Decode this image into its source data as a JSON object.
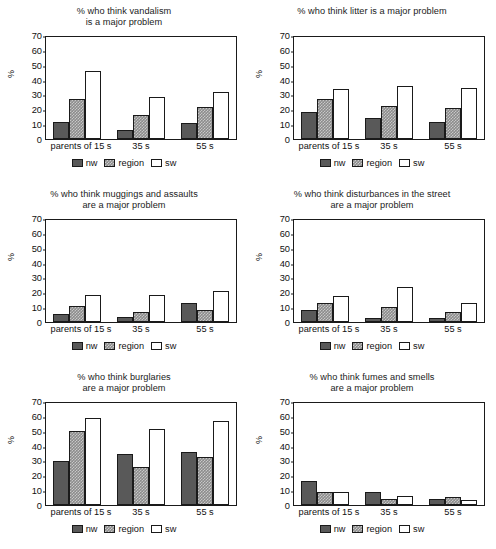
{
  "figure": {
    "axis_label_y": "%",
    "categories": [
      "parents of 15 s",
      "35 s",
      "55 s"
    ],
    "legend": [
      {
        "key": "nw",
        "label": "nw",
        "color": "#595959"
      },
      {
        "key": "region",
        "label": "region",
        "color": "#8c8c8c"
      },
      {
        "key": "sw",
        "label": "sw",
        "color": "#ffffff"
      }
    ],
    "y_ticks": [
      "0",
      "10",
      "20",
      "30",
      "40",
      "50",
      "60",
      "70"
    ]
  },
  "chart_data": [
    {
      "type": "bar",
      "title": "% who think vandalism is a major problem",
      "title_lines": [
        "% who think vandalism",
        "is a major problem"
      ],
      "categories": [
        "parents of 15 s",
        "35 s",
        "55 s"
      ],
      "series": [
        {
          "name": "nw",
          "values": [
            11.5,
            6,
            11
          ]
        },
        {
          "name": "region",
          "values": [
            27,
            16,
            21.5
          ]
        },
        {
          "name": "sw",
          "values": [
            46,
            28.5,
            31.5
          ]
        }
      ],
      "xlabel": "",
      "ylabel": "%",
      "ylim": [
        0,
        70
      ],
      "grid": false,
      "legend_position": "bottom"
    },
    {
      "type": "bar",
      "title": "% who think litter is a major problem",
      "title_lines": [
        "% who think litter is a major problem"
      ],
      "categories": [
        "parents of 15 s",
        "35 s",
        "55 s"
      ],
      "series": [
        {
          "name": "nw",
          "values": [
            18,
            14,
            11.5
          ]
        },
        {
          "name": "region",
          "values": [
            27,
            22.5,
            21
          ]
        },
        {
          "name": "sw",
          "values": [
            33.5,
            36,
            34.5
          ]
        }
      ],
      "xlabel": "",
      "ylabel": "%",
      "ylim": [
        0,
        70
      ],
      "grid": false,
      "legend_position": "bottom"
    },
    {
      "type": "bar",
      "title": "% who think muggings and assaults are a major problem",
      "title_lines": [
        "% who think muggings and assaults",
        "are a major problem"
      ],
      "categories": [
        "parents of 15 s",
        "35 s",
        "55 s"
      ],
      "series": [
        {
          "name": "nw",
          "values": [
            5.5,
            3.5,
            12.5
          ]
        },
        {
          "name": "region",
          "values": [
            11,
            6.5,
            8
          ]
        },
        {
          "name": "sw",
          "values": [
            18.5,
            18.5,
            21
          ]
        }
      ],
      "xlabel": "",
      "ylabel": "%",
      "ylim": [
        0,
        70
      ],
      "grid": false,
      "legend_position": "bottom"
    },
    {
      "type": "bar",
      "title": "% who think disturbances in the street are a major problem",
      "title_lines": [
        "% who think disturbances in the street",
        "are a major problem"
      ],
      "categories": [
        "parents of 15 s",
        "35 s",
        "55 s"
      ],
      "series": [
        {
          "name": "nw",
          "values": [
            8,
            3,
            2.5
          ]
        },
        {
          "name": "region",
          "values": [
            13,
            10,
            6.5
          ]
        },
        {
          "name": "sw",
          "values": [
            17.5,
            23.5,
            13
          ]
        }
      ],
      "xlabel": "",
      "ylabel": "%",
      "ylim": [
        0,
        70
      ],
      "grid": false,
      "legend_position": "bottom"
    },
    {
      "type": "bar",
      "title": "% who think burglaries are a major problem",
      "title_lines": [
        "% who think burglaries",
        "are a major problem"
      ],
      "categories": [
        "parents of 15 s",
        "35 s",
        "55 s"
      ],
      "series": [
        {
          "name": "nw",
          "values": [
            29.5,
            34.5,
            35.5
          ]
        },
        {
          "name": "region",
          "values": [
            49.5,
            25.5,
            32
          ]
        },
        {
          "name": "sw",
          "values": [
            58.5,
            51,
            56.5
          ]
        }
      ],
      "xlabel": "",
      "ylabel": "%",
      "ylim": [
        0,
        70
      ],
      "grid": false,
      "legend_position": "bottom"
    },
    {
      "type": "bar",
      "title": "% who think fumes and smells are a major problem",
      "title_lines": [
        "% who think fumes and smells",
        "are a major problem"
      ],
      "categories": [
        "parents of 15 s",
        "35 s",
        "55 s"
      ],
      "series": [
        {
          "name": "nw",
          "values": [
            16,
            8.5,
            4
          ]
        },
        {
          "name": "region",
          "values": [
            9,
            4,
            5.5
          ]
        },
        {
          "name": "sw",
          "values": [
            9,
            6,
            3.5
          ]
        }
      ],
      "xlabel": "",
      "ylabel": "%",
      "ylim": [
        0,
        70
      ],
      "grid": false,
      "legend_position": "bottom"
    }
  ]
}
